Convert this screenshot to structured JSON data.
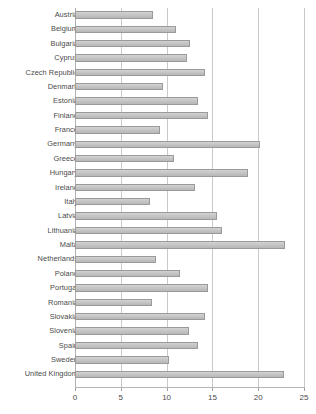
{
  "chart_data": {
    "type": "bar",
    "orientation": "horizontal",
    "title": "",
    "subtitle": "",
    "xlabel": "",
    "ylabel": "",
    "xlim": [
      0,
      25
    ],
    "xticks": [
      0,
      5,
      10,
      15,
      20,
      25
    ],
    "xtick_labels": [
      "0",
      "5",
      "10",
      "15",
      "20",
      "25"
    ],
    "grid": true,
    "grid_axis": "x",
    "legend": false,
    "legend_position": "none",
    "bar_color": "#c6c6c6",
    "bar_border_color": "#9a9a9a",
    "gridline_color": "#c9c9c9",
    "axis_color": "#b5b5b5",
    "label_color": "#4a4a4a",
    "categories": [
      "Austria",
      "Belgium",
      "Bulgaria",
      "Cyprus",
      "Czech Republic",
      "Denmark",
      "Estonia",
      "Finland",
      "France",
      "Germany",
      "Greece",
      "Hungary",
      "Ireland",
      "Italy",
      "Latvia",
      "Lithuania",
      "Malta",
      "Netherlands",
      "Poland",
      "Portugal",
      "Romania",
      "Slovakia",
      "Slovenia",
      "Spain",
      "Sweden",
      "United Kingdom"
    ],
    "values": [
      8.5,
      11.0,
      12.5,
      12.2,
      14.2,
      9.6,
      13.4,
      14.5,
      9.3,
      20.2,
      10.8,
      18.9,
      13.1,
      8.2,
      15.5,
      16.0,
      22.9,
      8.8,
      11.5,
      14.5,
      8.4,
      14.2,
      12.4,
      13.4,
      10.3,
      22.8
    ]
  }
}
